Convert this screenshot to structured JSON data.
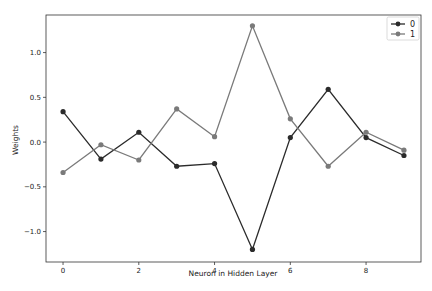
{
  "chart_data": {
    "type": "line",
    "title": "",
    "xlabel": "Neuron in Hidden Layer",
    "ylabel": "Weights",
    "x": [
      0,
      1,
      2,
      3,
      4,
      5,
      6,
      7,
      8,
      9
    ],
    "xticks": [
      0,
      2,
      4,
      6,
      8
    ],
    "xtick_labels": [
      "0",
      "2",
      "4",
      "6",
      "8"
    ],
    "yticks": [
      1.0,
      0.5,
      0.0,
      -0.5,
      -1.0
    ],
    "ytick_labels": [
      "1.0",
      "0.5",
      "0.0",
      "−0.5",
      "−1.0"
    ],
    "xlim": [
      -0.45,
      9.45
    ],
    "ylim": [
      -1.34,
      1.42
    ],
    "grid": false,
    "legend_position": "upper right",
    "series": [
      {
        "name": "0",
        "color": "#2b2b2b",
        "marker": "circle",
        "values": [
          0.34,
          -0.19,
          0.11,
          -0.27,
          -0.24,
          -1.2,
          0.05,
          0.59,
          0.05,
          -0.15
        ]
      },
      {
        "name": "1",
        "color": "#7a7a7a",
        "marker": "circle",
        "values": [
          -0.34,
          -0.03,
          -0.2,
          0.37,
          0.06,
          1.3,
          0.26,
          -0.27,
          0.11,
          -0.09
        ]
      }
    ]
  },
  "legend": {
    "items": [
      {
        "label": "0",
        "color": "#2b2b2b"
      },
      {
        "label": "1",
        "color": "#7a7a7a"
      }
    ]
  }
}
